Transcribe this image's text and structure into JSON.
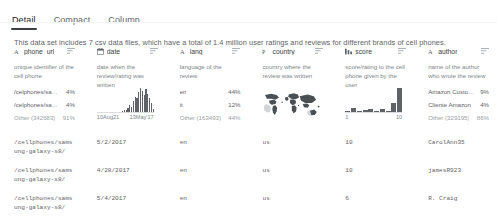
{
  "tabs": [
    {
      "label": "Detail",
      "active": true
    },
    {
      "label": "Compact",
      "active": false
    },
    {
      "label": "Column",
      "active": false
    }
  ],
  "description": "This data set includes 7 csv data files, which have a total of 1.4 million user ratings and reviews for different brands of cell phones.",
  "columns": [
    {
      "name": "phone_url",
      "type_icon": "text-type-icon",
      "menu_icon": "column-menu-icon",
      "description": "unique identifier of the cell phone",
      "viz": "categories",
      "categories": [
        {
          "label": "/celphones/samsun...",
          "pct": "4%"
        },
        {
          "label": "/celphones/samsun...",
          "pct": "4%"
        },
        {
          "label": "Other (342683)",
          "pct": "91%",
          "other": true
        }
      ]
    },
    {
      "name": "date",
      "type_icon": "date-type-icon",
      "menu_icon": "column-menu-icon",
      "description": "date when the review/rating was written",
      "viz": "histogram",
      "axis_min": "10Aug21",
      "axis_max": "13May'17"
    },
    {
      "name": "lang",
      "type_icon": "text-type-icon",
      "menu_icon": "column-menu-icon",
      "description": "language of the review",
      "viz": "categories",
      "categories": [
        {
          "label": "en",
          "pct": "44%"
        },
        {
          "label": "it",
          "pct": "12%"
        },
        {
          "label": "Other (163493)",
          "pct": "44%",
          "other": true
        }
      ]
    },
    {
      "name": "country",
      "type_icon": "geo-type-icon",
      "menu_icon": "column-menu-icon",
      "description": "country where the review was written",
      "viz": "map"
    },
    {
      "name": "score",
      "type_icon": "number-type-icon",
      "menu_icon": "column-menu-icon",
      "description": "score/rating to the cell phone given by the user",
      "viz": "histogram",
      "axis_min": "1",
      "axis_max": "10"
    },
    {
      "name": "author",
      "type_icon": "text-type-icon",
      "menu_icon": "column-menu-icon",
      "description": "name of the author who wrote the review",
      "viz": "categories",
      "categories": [
        {
          "label": "Amazon Customer",
          "pct": "9%"
        },
        {
          "label": "Cliente Amazon",
          "pct": "4%"
        },
        {
          "label": "Other (329195)",
          "pct": "86%",
          "other": true
        }
      ]
    }
  ],
  "chart_data": [
    {
      "type": "bar",
      "title": "date",
      "xlabel": "",
      "ylabel": "",
      "categories": [
        "10Aug21",
        "13May'17"
      ],
      "values": [
        0,
        0,
        0,
        0,
        0,
        0,
        0,
        0,
        0,
        0,
        0,
        0,
        0,
        0,
        1,
        2,
        2,
        4,
        7,
        5,
        11,
        14,
        13,
        19,
        23,
        20,
        16,
        22,
        17,
        13,
        9,
        3
      ],
      "xlim": [
        "10Aug21",
        "13May'17"
      ],
      "grid": false,
      "legend": "none"
    },
    {
      "type": "bar",
      "title": "score",
      "xlabel": "",
      "ylabel": "",
      "categories": [
        "1",
        "2",
        "3",
        "4",
        "5",
        "6",
        "7",
        "8",
        "9",
        "10"
      ],
      "values": [
        1,
        4,
        1,
        2,
        3,
        1,
        3,
        1,
        9,
        24
      ],
      "xlim": [
        "1",
        "10"
      ],
      "grid": false,
      "legend": "none"
    }
  ],
  "rows": [
    {
      "phone_url": "/cellphones/samsung-galaxy-s8/",
      "date": "5/2/2017",
      "lang": "en",
      "country": "us",
      "score": "10",
      "author": "CarolAnn35"
    },
    {
      "phone_url": "/cellphones/samsung-galaxy-s8/",
      "date": "4/28/2017",
      "lang": "en",
      "country": "us",
      "score": "10",
      "author": "jamesR923"
    },
    {
      "phone_url": "/cellphones/samsung-galaxy-s8/",
      "date": "5/4/2017",
      "lang": "en",
      "country": "us",
      "score": "6",
      "author": "R. Craig"
    }
  ]
}
